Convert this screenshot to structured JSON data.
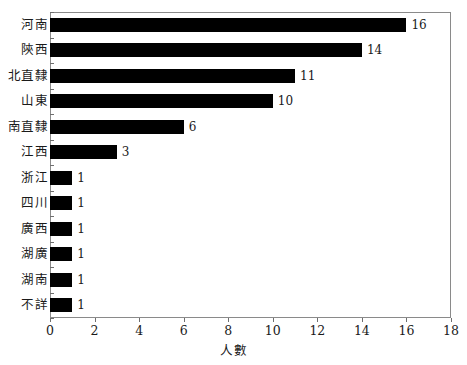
{
  "chart_data": {
    "type": "bar",
    "orientation": "horizontal",
    "title": "",
    "xlabel": "人數",
    "ylabel": "",
    "xlim": [
      0,
      18
    ],
    "xticks": [
      0,
      2,
      4,
      6,
      8,
      10,
      12,
      14,
      16,
      18
    ],
    "grid": false,
    "legend": null,
    "bar_color": "#000000",
    "frame_color": "#8a8a8a",
    "categories": [
      "河南",
      "陝西",
      "北直隸",
      "山東",
      "南直隸",
      "江西",
      "浙江",
      "四川",
      "廣西",
      "湖廣",
      "湖南",
      "不詳"
    ],
    "values": [
      16,
      14,
      11,
      10,
      6,
      3,
      1,
      1,
      1,
      1,
      1,
      1
    ],
    "data_labels": [
      "16",
      "14",
      "11",
      "10",
      "6",
      "3",
      "1",
      "1",
      "1",
      "1",
      "1",
      "1"
    ]
  }
}
